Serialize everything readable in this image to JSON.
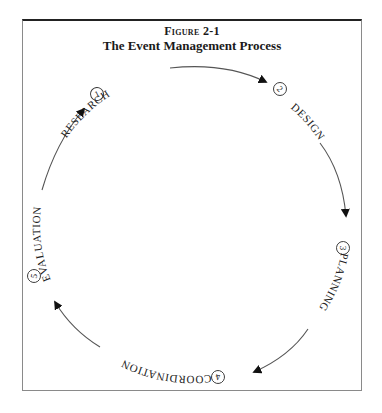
{
  "figure": {
    "label": "Figure 2-1",
    "title": "The Event Management Process"
  },
  "stages": [
    {
      "number": "1",
      "label": "RESEARCH"
    },
    {
      "number": "2",
      "label": "DESIGN"
    },
    {
      "number": "3",
      "label": "PLANNING"
    },
    {
      "number": "4",
      "label": "COORDINATION"
    },
    {
      "number": "5",
      "label": "EVALUATION"
    }
  ],
  "colors": {
    "text": "#222222",
    "arrow": "#555555",
    "arrowhead": "#111111",
    "frame": "#8a8a8a"
  }
}
